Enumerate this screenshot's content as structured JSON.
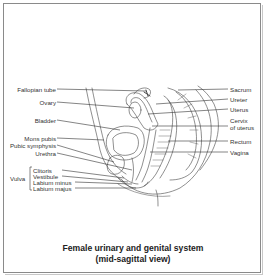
{
  "figure": {
    "caption_line1": "Female urinary and genital system",
    "caption_line2": "(mid-sagittal view)"
  },
  "labels_left": [
    {
      "id": "fallopian-tube",
      "text": "Fallopian tube"
    },
    {
      "id": "ovary",
      "text": "Ovary"
    },
    {
      "id": "bladder",
      "text": "Bladder"
    },
    {
      "id": "mons-pubis",
      "text": "Mons pubis"
    },
    {
      "id": "pubic-symphysis",
      "text": "Pubic symphysis"
    },
    {
      "id": "urethra",
      "text": "Urethra"
    }
  ],
  "vulva_group": {
    "label": "Vulva",
    "items": [
      {
        "id": "clitoris",
        "text": "Clitoris"
      },
      {
        "id": "vestibule",
        "text": "Vestibule"
      },
      {
        "id": "labium-minus",
        "text": "Labium minus"
      },
      {
        "id": "labium-majus",
        "text": "Labium majus"
      }
    ]
  },
  "labels_right": [
    {
      "id": "sacrum",
      "text": "Sacrum"
    },
    {
      "id": "ureter",
      "text": "Ureter"
    },
    {
      "id": "uterus",
      "text": "Uterus"
    },
    {
      "id": "cervix",
      "text": "Cervix",
      "text2": "of uterus"
    },
    {
      "id": "rectum",
      "text": "Rectum"
    },
    {
      "id": "vagina",
      "text": "Vagina"
    }
  ]
}
